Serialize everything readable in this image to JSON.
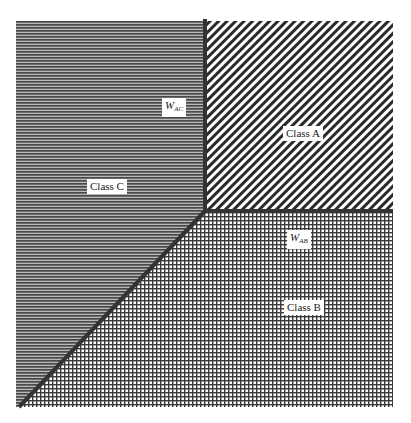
{
  "diagram": {
    "regions": [
      {
        "id": "class-a",
        "label": "Class A",
        "pattern": "diagonal-hatch",
        "color": "#2a2a2a"
      },
      {
        "id": "class-b",
        "label": "Class B",
        "pattern": "crosshatch-grid",
        "color": "#3a3a3a"
      },
      {
        "id": "class-c",
        "label": "Class C",
        "pattern": "horizontal-lines",
        "color": "#555555"
      }
    ],
    "boundaries": [
      {
        "id": "w-ac",
        "symbol": "W",
        "subscript": "AC",
        "between": [
          "Class A",
          "Class C"
        ],
        "orientation": "vertical"
      },
      {
        "id": "w-ab",
        "symbol": "W",
        "subscript": "AB",
        "between": [
          "Class A",
          "Class B"
        ],
        "orientation": "horizontal"
      },
      {
        "id": "w-bc",
        "between": [
          "Class B",
          "Class C"
        ],
        "orientation": "diagonal"
      }
    ],
    "colors": {
      "boundary": "#333333",
      "background": "#ffffff"
    }
  }
}
